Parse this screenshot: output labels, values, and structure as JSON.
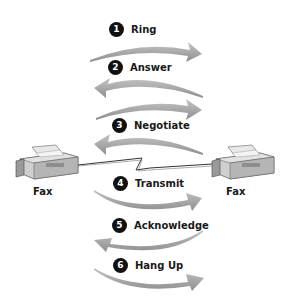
{
  "diagram": {
    "type": "fax-handshake-sequence",
    "nodes": {
      "left": {
        "label": "Fax"
      },
      "right": {
        "label": "Fax"
      }
    },
    "steps": [
      {
        "number": "1",
        "label": "Ring",
        "direction": "right"
      },
      {
        "number": "2",
        "label": "Answer",
        "direction": "left"
      },
      {
        "number": "3",
        "label": "Negotiate",
        "direction": "both"
      },
      {
        "number": "4",
        "label": "Transmit",
        "direction": "right"
      },
      {
        "number": "5",
        "label": "Acknowledge",
        "direction": "left"
      },
      {
        "number": "6",
        "label": "Hang Up",
        "direction": "right"
      }
    ],
    "colors": {
      "arrow": "#b0b0b0",
      "arrow_dark": "#8c8c8c",
      "badge": "#111111",
      "text": "#1a1a1a",
      "fax_body": "#c8c8c8"
    }
  }
}
